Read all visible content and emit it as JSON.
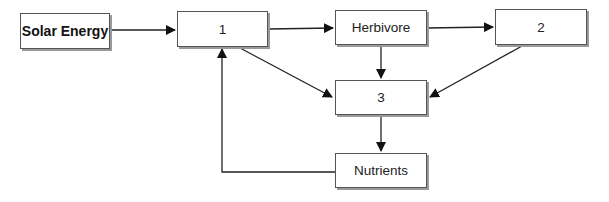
{
  "diagram": {
    "nodes": [
      {
        "id": "solar",
        "label": "Solar Energy",
        "x": 20,
        "y": 13,
        "w": 90,
        "h": 36,
        "bold": true
      },
      {
        "id": "n1",
        "label": "1",
        "x": 177,
        "y": 11,
        "w": 91,
        "h": 36
      },
      {
        "id": "herbivore",
        "label": "Herbivore",
        "x": 335,
        "y": 10,
        "w": 92,
        "h": 35
      },
      {
        "id": "n2",
        "label": "2",
        "x": 495,
        "y": 9,
        "w": 92,
        "h": 36
      },
      {
        "id": "n3",
        "label": "3",
        "x": 335,
        "y": 80,
        "w": 92,
        "h": 35
      },
      {
        "id": "nutrients",
        "label": "Nutrients",
        "x": 335,
        "y": 153,
        "w": 92,
        "h": 35
      }
    ],
    "edges": [
      {
        "from": "solar",
        "to": "n1"
      },
      {
        "from": "n1",
        "to": "herbivore"
      },
      {
        "from": "herbivore",
        "to": "n2"
      },
      {
        "from": "herbivore",
        "to": "n3"
      },
      {
        "from": "n1",
        "to": "n3"
      },
      {
        "from": "n2",
        "to": "n3"
      },
      {
        "from": "n3",
        "to": "nutrients"
      },
      {
        "from": "nutrients",
        "to": "n1"
      }
    ]
  }
}
